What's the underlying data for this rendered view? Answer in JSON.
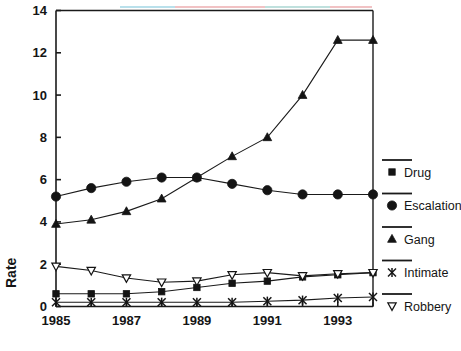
{
  "chart_data": {
    "type": "line",
    "title": "",
    "xlabel": "",
    "ylabel": "Rate",
    "xlim": [
      1985,
      1994
    ],
    "ylim": [
      0,
      14
    ],
    "yticks": [
      0,
      2,
      4,
      6,
      8,
      10,
      12,
      14
    ],
    "ytick_labels": [
      "0",
      "2",
      "4",
      "6",
      "8",
      "10",
      "12",
      "14"
    ],
    "x": [
      1985,
      1986,
      1987,
      1988,
      1989,
      1990,
      1991,
      1992,
      1993,
      1994
    ],
    "xticks": [
      1985,
      1986,
      1987,
      1988,
      1989,
      1990,
      1991,
      1992,
      1993,
      1994
    ],
    "xtick_labels": [
      "1985",
      "",
      "1987",
      "",
      "1989",
      "",
      "1991",
      "",
      "1993",
      ""
    ],
    "xtick_labels_shown": [
      "1985",
      "1987",
      "1989",
      "1991",
      "1993"
    ],
    "grid": false,
    "legend_position": "right",
    "series": [
      {
        "name": "Drug",
        "marker": "square-filled",
        "values": [
          0.6,
          0.6,
          0.6,
          0.7,
          0.9,
          1.1,
          1.2,
          1.4,
          1.5,
          1.6
        ]
      },
      {
        "name": "Escalation",
        "marker": "circle-filled",
        "values": [
          5.2,
          5.6,
          5.9,
          6.1,
          6.1,
          5.8,
          5.5,
          5.3,
          5.3,
          5.3
        ]
      },
      {
        "name": "Gang",
        "marker": "triangle-up-filled",
        "values": [
          3.9,
          4.1,
          4.5,
          5.1,
          6.1,
          7.1,
          8.0,
          10.0,
          12.6,
          12.6
        ]
      },
      {
        "name": "Intimate",
        "marker": "asterisk",
        "values": [
          0.2,
          0.2,
          0.2,
          0.2,
          0.2,
          0.2,
          0.25,
          0.3,
          0.4,
          0.45
        ]
      },
      {
        "name": "Robbery",
        "marker": "triangle-down-open",
        "values": [
          1.9,
          1.7,
          1.35,
          1.15,
          1.2,
          1.5,
          1.6,
          1.45,
          1.55,
          1.6
        ]
      }
    ]
  },
  "axes": {
    "y_title": "Rate"
  },
  "legend": {
    "entries": [
      {
        "label": "Drug",
        "marker": "square-filled"
      },
      {
        "label": "Escalation",
        "marker": "circle-filled"
      },
      {
        "label": "Gang",
        "marker": "triangle-up-filled"
      },
      {
        "label": "Intimate",
        "marker": "asterisk"
      },
      {
        "label": "Robbery",
        "marker": "triangle-down-open"
      }
    ]
  },
  "colors": {
    "ink": "#1a1a1a",
    "background": "#ffffff",
    "marker": "#141414"
  }
}
